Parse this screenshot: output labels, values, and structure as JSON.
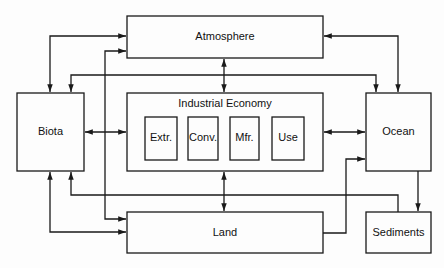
{
  "diagram": {
    "type": "flow",
    "nodes": {
      "atmosphere": "Atmosphere",
      "industrial": "Industrial Economy",
      "biota": "Biota",
      "ocean": "Ocean",
      "land": "Land",
      "sediments": "Sediments",
      "stages": [
        "Extr.",
        "Conv.",
        "Mfr.",
        "Use"
      ]
    },
    "edges": [
      {
        "from": "biota",
        "to": "atmosphere",
        "bidirectional": true
      },
      {
        "from": "atmosphere",
        "to": "land",
        "bidirectional": true
      },
      {
        "from": "atmosphere",
        "to": "ocean",
        "bidirectional": true
      },
      {
        "from": "atmosphere",
        "to": "industrial",
        "bidirectional": true
      },
      {
        "from": "industrial",
        "to": "biota",
        "bidirectional": true
      },
      {
        "from": "industrial",
        "to": "ocean",
        "bidirectional": true
      },
      {
        "from": "industrial",
        "to": "land",
        "bidirectional": true
      },
      {
        "from": "biota",
        "to": "ocean",
        "bidirectional": true
      },
      {
        "from": "sediments",
        "to": "biota",
        "bidirectional": false
      },
      {
        "from": "biota",
        "to": "land",
        "bidirectional": true
      },
      {
        "from": "land",
        "to": "ocean",
        "bidirectional": false
      },
      {
        "from": "ocean",
        "to": "sediments",
        "bidirectional": false
      }
    ],
    "colors": {
      "line": "#1a1a1a",
      "background": "#fdfdfd"
    }
  }
}
